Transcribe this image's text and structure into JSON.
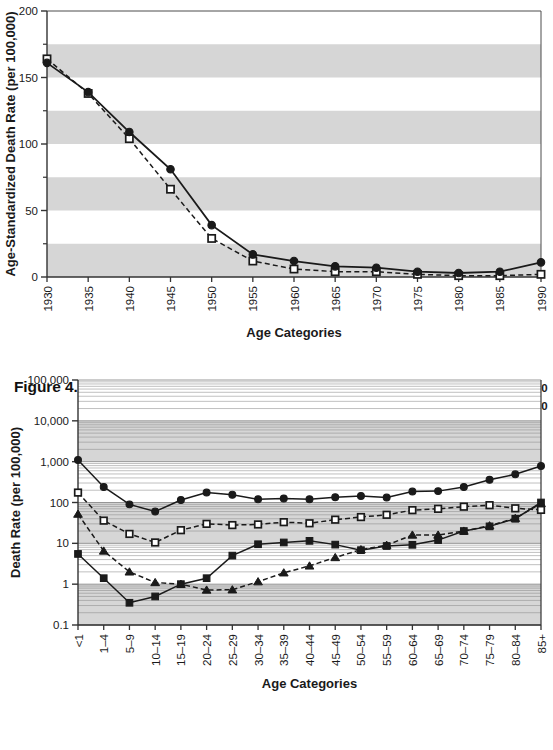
{
  "figure": {
    "number": "Figure 4.12",
    "bullet": "◆",
    "title_line1": "Infectious Death Rate by Age,",
    "title_line2": "Both, 1930-1990"
  },
  "legend": {
    "position": "top-right",
    "entries": [
      {
        "label": "1930",
        "marker": "filled-circle",
        "line": "solid"
      },
      {
        "label": "1970",
        "marker": "filled-triangle",
        "line": "dashed"
      },
      {
        "label": "1950",
        "marker": "open-square",
        "line": "dashed"
      },
      {
        "label": "1990",
        "marker": "filled-square",
        "line": "solid"
      }
    ]
  },
  "colors": {
    "ink": "#1a1a1a",
    "band": "#d6d6d6",
    "grid": "#8c8c8c",
    "axis": "#4d4d4d",
    "marker_fill": "#1a1a1a",
    "marker_open": "#ffffff"
  },
  "chart_data": [
    {
      "id": "top",
      "type": "line",
      "title": "",
      "xlabel": "Age Categories",
      "ylabel": "Age-Standardized Death Rate (per 100,000)",
      "scale": "linear",
      "ylim": [
        0,
        200
      ],
      "yticks": [
        0,
        50,
        100,
        150,
        200
      ],
      "yticks_minor": [
        25,
        75,
        125,
        175
      ],
      "ytick_labels": [
        "0",
        "50",
        "100",
        "150",
        "200"
      ],
      "bands": [
        [
          0,
          25
        ],
        [
          50,
          75
        ],
        [
          100,
          125
        ],
        [
          150,
          175
        ]
      ],
      "grid": "horizontal-bands",
      "categories": [
        "1930",
        "1935",
        "1940",
        "1945",
        "1950",
        "1955",
        "1960",
        "1965",
        "1970",
        "1975",
        "1980",
        "1985",
        "1990"
      ],
      "series": [
        {
          "name": "Male",
          "marker": "filled-circle",
          "line": "solid",
          "values": [
            161,
            139,
            109,
            81,
            39,
            17,
            12,
            8,
            7,
            4,
            3,
            4,
            11
          ]
        },
        {
          "name": "Female",
          "marker": "open-square",
          "line": "dashed",
          "values": [
            164,
            138,
            104,
            66,
            29,
            12,
            6,
            4,
            4,
            2,
            1,
            1,
            2
          ]
        }
      ]
    },
    {
      "id": "bottom",
      "type": "line",
      "title": "Infectious Death Rate by Age, Both, 1930-1990",
      "xlabel": "Age Categories",
      "ylabel": "Death Rate (per 100,000)",
      "scale": "log",
      "ylim": [
        0.1,
        100000
      ],
      "yticks": [
        0.1,
        1,
        10,
        100,
        1000,
        10000,
        100000
      ],
      "ytick_labels": [
        "0.1",
        "1",
        "10",
        "100",
        "1,000",
        "10,000",
        "100,000"
      ],
      "bands": [
        [
          0.1,
          1
        ],
        [
          10,
          100
        ],
        [
          1000,
          10000
        ]
      ],
      "grid": "log-minor-horizontal",
      "categories": [
        "<1",
        "1–4",
        "5–9",
        "10–14",
        "15–19",
        "20–24",
        "25–29",
        "30–34",
        "35–39",
        "40–44",
        "45–49",
        "50–54",
        "55–59",
        "60–64",
        "65–69",
        "70–74",
        "75–79",
        "80–84",
        "85+"
      ],
      "series": [
        {
          "name": "1930",
          "marker": "filled-circle",
          "line": "solid",
          "values": [
            1100,
            240,
            90,
            60,
            115,
            175,
            155,
            120,
            125,
            120,
            135,
            145,
            132,
            185,
            190,
            240,
            360,
            490,
            780
          ]
        },
        {
          "name": "1950",
          "marker": "open-square",
          "line": "dashed",
          "values": [
            175,
            36,
            17,
            10.5,
            21,
            30,
            28,
            29,
            33,
            31,
            38,
            44,
            50,
            65,
            70,
            79,
            86,
            72,
            66
          ]
        },
        {
          "name": "1970",
          "marker": "filled-triangle",
          "line": "dashed",
          "values": [
            52,
            6.5,
            2.0,
            1.1,
            1.0,
            0.72,
            0.73,
            1.15,
            1.9,
            2.8,
            4.5,
            7.0,
            9.0,
            16,
            16,
            20,
            27,
            41,
            95
          ]
        },
        {
          "name": "1990",
          "marker": "filled-square",
          "line": "solid",
          "values": [
            5.5,
            1.4,
            0.35,
            0.5,
            1.0,
            1.4,
            5.0,
            9.5,
            10.5,
            11.5,
            9.3,
            6.8,
            8.6,
            9.2,
            12,
            20,
            26,
            40,
            100
          ]
        }
      ]
    }
  ]
}
